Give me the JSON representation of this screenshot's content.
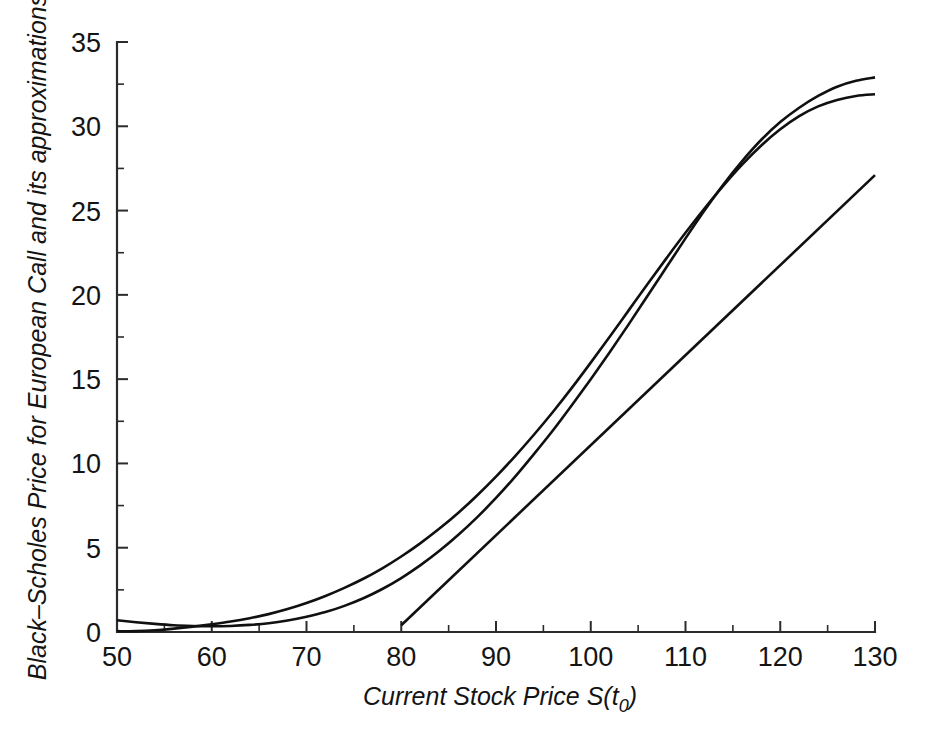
{
  "chart_data": {
    "type": "line",
    "title": "",
    "xlabel": "Current Stock Price S(t0)",
    "xlabel_main": "Current Stock Price S(t",
    "xlabel_sub": "0",
    "xlabel_tail": ")",
    "ylabel": "Black–Scholes Price for European Call and its approximations",
    "xlim": [
      50,
      130
    ],
    "ylim": [
      0,
      35
    ],
    "xticks": [
      50,
      60,
      70,
      80,
      90,
      100,
      110,
      120,
      130
    ],
    "yticks": [
      0,
      5,
      10,
      15,
      20,
      25,
      30,
      35
    ],
    "xticklabels": [
      "50",
      "60",
      "70",
      "80",
      "90",
      "100",
      "110",
      "120",
      "130"
    ],
    "yticklabels": [
      "0",
      "5",
      "10",
      "15",
      "20",
      "25",
      "30",
      "35"
    ],
    "xminorticks": [
      55,
      65,
      75,
      85,
      95,
      105,
      115,
      125
    ],
    "yminorticks": [
      2.5,
      7.5,
      12.5,
      17.5,
      22.5,
      27.5,
      32.5
    ],
    "grid": false,
    "legend": "none",
    "line_color": "#101010",
    "axis_color": "#2b2b2b",
    "background": "#ffffff",
    "series": [
      {
        "name": "Black-Scholes price",
        "comment": "exact call price curve, convex, ends at 32.9 at S=130",
        "x": [
          50,
          52,
          54,
          56,
          58,
          60,
          62,
          64,
          66,
          68,
          70,
          72,
          74,
          76,
          78,
          80,
          82,
          84,
          86,
          88,
          90,
          92,
          94,
          96,
          98,
          100,
          102,
          104,
          106,
          108,
          110,
          112,
          114,
          116,
          118,
          120,
          122,
          124,
          126,
          128,
          130
        ],
        "y": [
          0.7,
          0.58,
          0.48,
          0.4,
          0.36,
          0.34,
          0.36,
          0.42,
          0.52,
          0.68,
          0.9,
          1.18,
          1.55,
          2.0,
          2.55,
          3.2,
          3.95,
          4.8,
          5.75,
          6.8,
          7.95,
          9.2,
          10.55,
          11.95,
          13.45,
          15.0,
          16.6,
          18.25,
          19.95,
          21.65,
          23.35,
          25.0,
          26.55,
          27.95,
          29.2,
          30.25,
          31.1,
          31.8,
          32.35,
          32.7,
          32.9
        ]
      },
      {
        "name": "Second-order (delta-gamma) approximation",
        "comment": "quadratic approximation about S=100, ends at 31.9 at S=130",
        "x": [
          50,
          52,
          54,
          56,
          58,
          60,
          62,
          64,
          66,
          68,
          70,
          72,
          74,
          76,
          78,
          80,
          82,
          84,
          86,
          88,
          90,
          92,
          94,
          96,
          98,
          100,
          102,
          104,
          106,
          108,
          110,
          112,
          114,
          116,
          118,
          120,
          122,
          124,
          126,
          128,
          130
        ],
        "y": [
          0.05,
          0.05,
          0.1,
          0.2,
          0.32,
          0.46,
          0.62,
          0.82,
          1.06,
          1.36,
          1.72,
          2.14,
          2.62,
          3.16,
          3.78,
          4.48,
          5.26,
          6.12,
          7.06,
          8.1,
          9.22,
          10.42,
          11.7,
          13.05,
          14.48,
          15.98,
          17.52,
          19.08,
          20.64,
          22.18,
          23.68,
          25.12,
          26.48,
          27.74,
          28.86,
          29.82,
          30.6,
          31.18,
          31.56,
          31.8,
          31.9
        ]
      },
      {
        "name": "First-order (delta) approximation",
        "comment": "tangent line at S=100, drawn from S=80 to S=130",
        "x": [
          80,
          130
        ],
        "y": [
          0.4,
          27.1
        ]
      }
    ]
  }
}
